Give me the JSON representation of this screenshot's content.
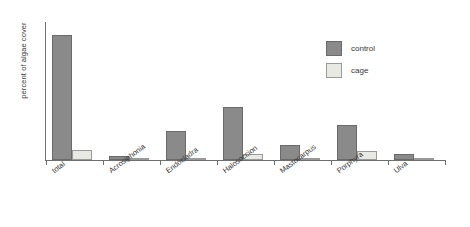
{
  "chart_data": {
    "type": "bar",
    "title": "",
    "subtitle": "",
    "xlabel": "",
    "ylabel": "percent of algae cover",
    "grid": false,
    "legend_position": "top-right",
    "axis_tick_labels": [],
    "ylim": [
      0,
      110
    ],
    "categories": [
      "total",
      "Acrosiphonia",
      "Endocladra",
      "Halosoccion",
      "Mastocarpus",
      "Porphyra",
      "Ulva"
    ],
    "series": [
      {
        "name": "control",
        "color": "#8a8a8a",
        "values": [
          100,
          3,
          23,
          42,
          12,
          28,
          5
        ]
      },
      {
        "name": "cage",
        "color": "#e9e9e4",
        "values": [
          8,
          0,
          0,
          5,
          0,
          7,
          0
        ]
      }
    ]
  },
  "legend": {
    "items": [
      {
        "label": "control",
        "swatch": "control"
      },
      {
        "label": "cage",
        "swatch": "cage"
      }
    ]
  }
}
